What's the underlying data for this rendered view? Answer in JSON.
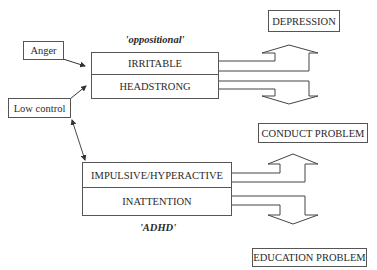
{
  "diagram": {
    "inputs": {
      "anger": "Anger",
      "low_control": "Low control"
    },
    "oppositional_group": {
      "caption": "'oppositional'",
      "rows": [
        "IRRITABLE",
        "HEADSTRONG"
      ]
    },
    "adhd_group": {
      "caption": "'ADHD'",
      "rows": [
        "IMPULSIVE/HYPERACTIVE",
        "INATTENTION"
      ]
    },
    "outcomes": {
      "depression": "DEPRESSION",
      "conduct_problem": "CONDUCT PROBLEM",
      "education_problem": "EDUCATION PROBLEM"
    },
    "edges": [
      {
        "from": "Anger",
        "to": "oppositional",
        "type": "arrow"
      },
      {
        "from": "Low control",
        "to": "oppositional",
        "type": "arrow"
      },
      {
        "from": "Low control",
        "to": "ADHD",
        "type": "double-arrow"
      },
      {
        "from": "IRRITABLE",
        "to": "DEPRESSION",
        "type": "block-arrow-up"
      },
      {
        "from": "HEADSTRONG",
        "to": "CONDUCT PROBLEM",
        "type": "block-arrow-down"
      },
      {
        "from": "IMPULSIVE/HYPERACTIVE",
        "to": "CONDUCT PROBLEM",
        "type": "block-arrow-up"
      },
      {
        "from": "INATTENTION",
        "to": "EDUCATION PROBLEM",
        "type": "block-arrow-down"
      }
    ]
  }
}
